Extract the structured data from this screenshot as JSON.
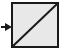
{
  "figure": {
    "name": "diagonal-square-with-incoming-arrow",
    "canvas": {
      "width": 64,
      "height": 54,
      "background": "#ffffff"
    },
    "colors": {
      "background": "#ffffff",
      "box_fill": "#e8e8e8",
      "box_stroke": "#1a1a1a",
      "diagonal_stroke": "#1a1a1a",
      "arrow_stroke": "#1a1a1a",
      "outer_margin_fill": "#f2f2f2"
    },
    "elements": {
      "box": {
        "label": "square-box",
        "x": 11,
        "y": 2,
        "width": 48,
        "height": 46,
        "stroke_width": 2,
        "fill": "#e8e8e8"
      },
      "diagonal": {
        "label": "diagonal-line",
        "direction": "bottom-left-to-top-right",
        "x1": 12,
        "y1": 47,
        "x2": 58,
        "y2": 3,
        "stroke_width": 2
      },
      "arrow": {
        "label": "incoming-arrow",
        "direction": "right",
        "x1": 1,
        "y1": 27,
        "x2": 11,
        "y2": 27,
        "stroke_width": 2,
        "head_length": 5,
        "head_half_width": 4
      }
    }
  }
}
